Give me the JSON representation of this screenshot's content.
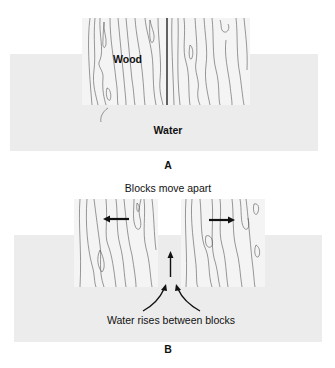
{
  "panels": [
    {
      "id": "A",
      "panel_label": "A",
      "wood_label": "Wood",
      "water_label": "Water"
    },
    {
      "id": "B",
      "panel_label": "B",
      "title": "Blocks move apart",
      "caption": "Water rises between blocks"
    }
  ],
  "colors": {
    "water": "#ececec",
    "wood": "#f3f3f3",
    "grain": "#555555",
    "arrow": "#111111",
    "text": "#111111"
  }
}
